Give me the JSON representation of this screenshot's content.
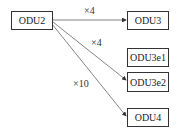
{
  "diagram": {
    "source": {
      "label": "ODU2"
    },
    "targets": [
      {
        "label": "ODU3"
      },
      {
        "label": "ODU3e1"
      },
      {
        "label": "ODU3e2"
      },
      {
        "label": "ODU4"
      }
    ],
    "edges": [
      {
        "from": "ODU2",
        "to": "ODU3",
        "label": "×4"
      },
      {
        "from": "ODU2",
        "to": "ODU3e2",
        "label": "×4"
      },
      {
        "from": "ODU2",
        "to": "ODU4",
        "label": "×10"
      }
    ],
    "colors": {
      "line": "#555555",
      "border": "#333333",
      "text": "#222222"
    }
  }
}
